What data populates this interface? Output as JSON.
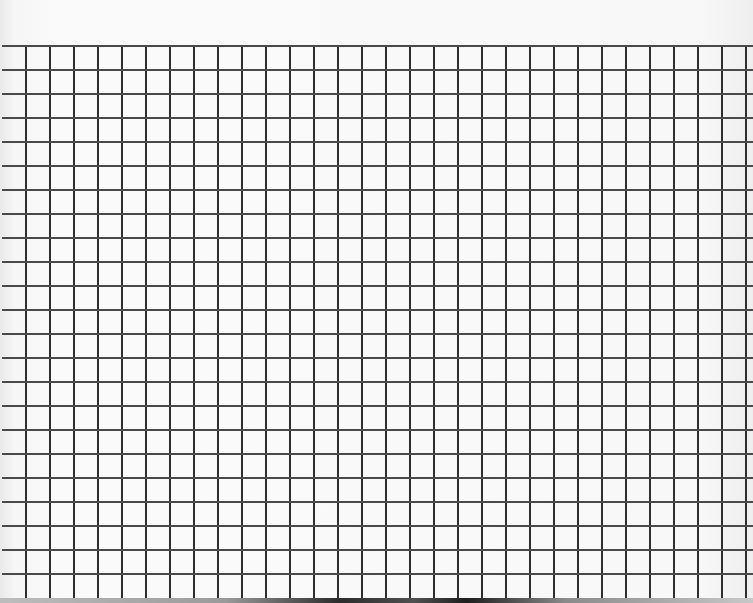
{
  "scene": {
    "subject": "graph-paper",
    "colors": {
      "paper": "#f8f8f8",
      "grid_line": "#333333"
    },
    "grid": {
      "first_vertical_x": 25,
      "vertical_spacing": 24.0,
      "vertical_count": 31,
      "first_horizontal_y": 45,
      "horizontal_spacing": 24.0,
      "horizontal_count": 23,
      "grid_bottom_y": 598,
      "grid_right_x": 753
    }
  }
}
